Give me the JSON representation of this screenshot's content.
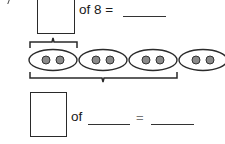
{
  "problem": {
    "top_equation": {
      "of_label": "of 8 =",
      "answer_blank": ""
    },
    "groups": {
      "count": 4,
      "dots_per_group": 2,
      "dot_color": "#8a8a8a",
      "outline_color": "#2a2a2a"
    },
    "bottom_equation": {
      "of_label": "of",
      "equals": "=",
      "whole_blank": "",
      "answer_blank": ""
    }
  }
}
